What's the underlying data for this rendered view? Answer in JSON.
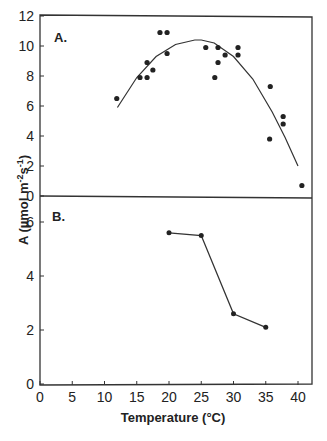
{
  "chart_data": [
    {
      "panel": "A.",
      "type": "scatter",
      "xlabel": "Temperature (°C)",
      "ylabel": "A (µmol m -2s -1)",
      "xlim": [
        0,
        40
      ],
      "ylim": [
        0,
        12
      ],
      "yticks": [
        0,
        2,
        4,
        6,
        8,
        10,
        12
      ],
      "grid": false,
      "points": [
        [
          11.9,
          6.5
        ],
        [
          15.5,
          7.9
        ],
        [
          16.6,
          7.9
        ],
        [
          16.6,
          8.9
        ],
        [
          17.5,
          8.4
        ],
        [
          18.6,
          10.9
        ],
        [
          19.7,
          10.9
        ],
        [
          19.7,
          9.5
        ],
        [
          25.7,
          9.9
        ],
        [
          27.6,
          9.9
        ],
        [
          27.6,
          8.9
        ],
        [
          27.1,
          7.9
        ],
        [
          28.7,
          9.4
        ],
        [
          30.7,
          9.9
        ],
        [
          30.7,
          9.4
        ],
        [
          35.7,
          7.3
        ],
        [
          35.6,
          3.8
        ],
        [
          37.7,
          5.3
        ],
        [
          37.7,
          4.8
        ],
        [
          40.6,
          0.7
        ]
      ],
      "fit_curve": {
        "type": "quadratic",
        "x": [
          12,
          15,
          18,
          21,
          24,
          25,
          27,
          30,
          33,
          36,
          38,
          40
        ],
        "y": [
          5.9,
          7.9,
          9.3,
          10.1,
          10.4,
          10.4,
          10.2,
          9.3,
          7.8,
          5.6,
          3.9,
          2.0
        ]
      }
    },
    {
      "panel": "B.",
      "type": "line",
      "xlabel": "Temperature (°C)",
      "ylabel": "A (µmol m -2s -1)",
      "xlim": [
        0,
        40
      ],
      "ylim": [
        0,
        6
      ],
      "yticks": [
        0,
        2,
        4,
        6
      ],
      "xticks": [
        0,
        5,
        10,
        15,
        20,
        25,
        30,
        35,
        40
      ],
      "grid": false,
      "x": [
        20,
        25,
        30,
        35
      ],
      "values": [
        5.6,
        5.5,
        2.6,
        2.1
      ]
    }
  ],
  "labels": {
    "panel_a": "A.",
    "panel_b": "B.",
    "xlabel": "Temperature (°C)",
    "ylabel": "A (µmol m",
    "ylabel_sup1": "-2",
    "ylabel_mid": "s",
    "ylabel_sup2": "-1",
    "ylabel_end": ")"
  },
  "ticks": {
    "a_y": [
      "0",
      "2",
      "4",
      "6",
      "8",
      "10",
      "12"
    ],
    "b_y": [
      "0",
      "2",
      "4",
      "6"
    ],
    "x": [
      "0",
      "5",
      "10",
      "15",
      "20",
      "25",
      "30",
      "35",
      "40"
    ]
  }
}
